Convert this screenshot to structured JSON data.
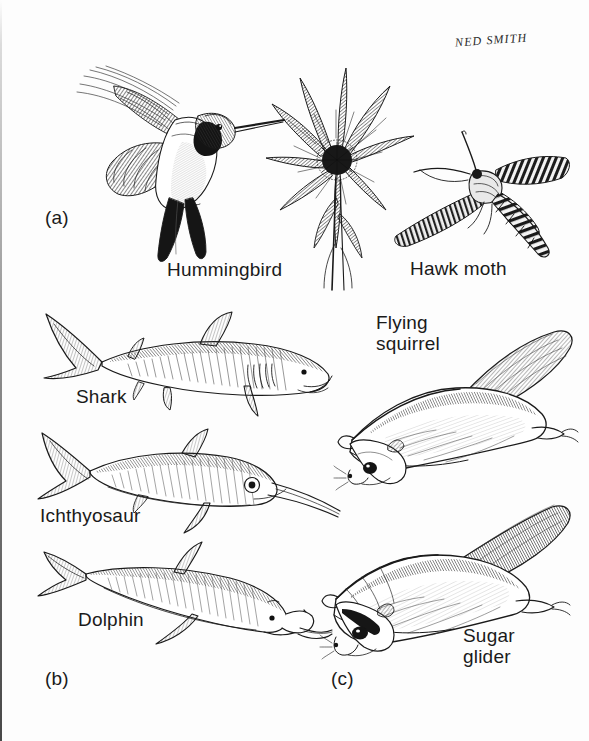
{
  "figure": {
    "background_color": "#fdfdfd",
    "ink_color": "#1a1a1a",
    "signature": "NED SMITH",
    "style": "pen-and-ink scientific illustration"
  },
  "panels": [
    {
      "letter": "(a)",
      "theme": "hovering nectar feeders",
      "subjects": [
        {
          "label": "Hummingbird",
          "kind": "bird"
        },
        {
          "label": "Hawk moth",
          "kind": "insect"
        }
      ],
      "props": [
        {
          "name": "thistle-flower",
          "kind": "plant"
        }
      ]
    },
    {
      "letter": "(b)",
      "theme": "streamlined aquatic body forms",
      "subjects": [
        {
          "label": "Shark",
          "kind": "fish"
        },
        {
          "label": "Ichthyosaur",
          "kind": "reptile"
        },
        {
          "label": "Dolphin",
          "kind": "mammal"
        }
      ]
    },
    {
      "letter": "(c)",
      "theme": "gliding membranes",
      "subjects": [
        {
          "label": "Flying\nsquirrel",
          "kind": "placental mammal"
        },
        {
          "label": "Sugar\nglider",
          "kind": "marsupial"
        }
      ]
    }
  ],
  "labels": {
    "hummingbird": "Hummingbird",
    "hawk_moth": "Hawk moth",
    "shark": "Shark",
    "ichthyosaur": "Ichthyosaur",
    "dolphin": "Dolphin",
    "flying_squirrel": "Flying\nsquirrel",
    "sugar_glider": "Sugar\nglider",
    "panel_a": "(a)",
    "panel_b": "(b)",
    "panel_c": "(c)",
    "signature": "NED SMITH"
  }
}
